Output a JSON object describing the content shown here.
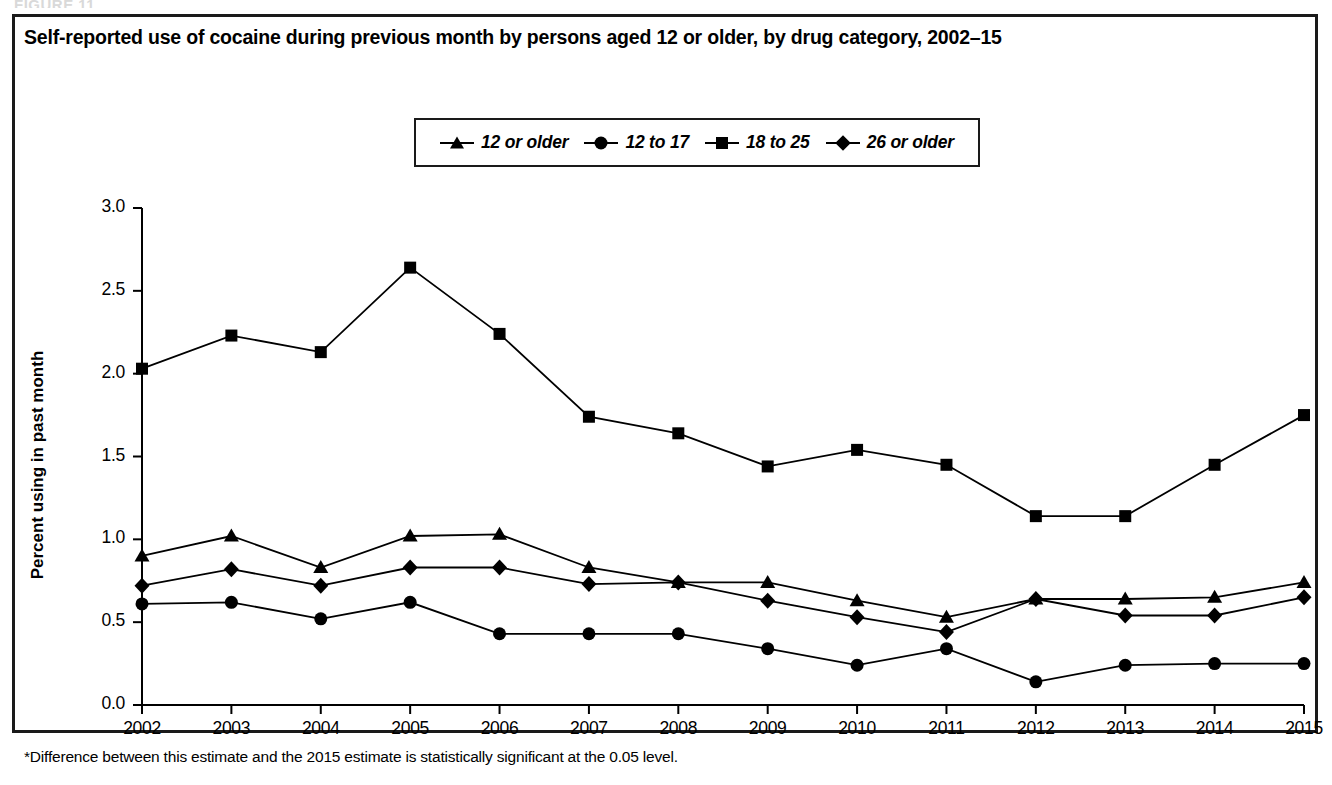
{
  "figure": {
    "number_label": "FIGURE 11",
    "title": "Self-reported use of cocaine during previous month by persons aged 12 or older, by drug category, 2002–15",
    "footnote": "*Difference between this estimate and the 2015 estimate is statistically significant at the 0.05 level."
  },
  "axes": {
    "y_title": "Percent using in past month",
    "y_ticks": [
      "0.0",
      "0.5",
      "1.0",
      "1.5",
      "2.0",
      "2.5",
      "3.0"
    ],
    "x_ticks": [
      "2002",
      "2003",
      "2004",
      "2005",
      "2006",
      "2007",
      "2008",
      "2009",
      "2010",
      "2011",
      "2012",
      "2013",
      "2014",
      "2015"
    ]
  },
  "legend": {
    "items": [
      {
        "label": "12 or older",
        "marker": "triangle-marker-icon"
      },
      {
        "label": "12 to 17",
        "marker": "circle-marker-icon"
      },
      {
        "label": "18 to 25",
        "marker": "square-marker-icon"
      },
      {
        "label": "26 or older",
        "marker": "diamond-marker-icon"
      }
    ]
  },
  "colors": {
    "ink": "#000000",
    "frame": "#1a1a1a",
    "background": "#ffffff"
  },
  "chart_data": {
    "type": "line",
    "title": "Self-reported use of cocaine during previous month by persons aged 12 or older, by drug category, 2002–15",
    "xlabel": "",
    "ylabel": "Percent using in past month",
    "x": [
      2002,
      2003,
      2004,
      2005,
      2006,
      2007,
      2008,
      2009,
      2010,
      2011,
      2012,
      2013,
      2014,
      2015
    ],
    "categories": [
      "2002",
      "2003",
      "2004",
      "2005",
      "2006",
      "2007",
      "2008",
      "2009",
      "2010",
      "2011",
      "2012",
      "2013",
      "2014",
      "2015"
    ],
    "ylim": [
      0.0,
      3.0
    ],
    "ytick_step": 0.5,
    "grid": false,
    "legend_position": "top-center",
    "series": [
      {
        "name": "12 or older",
        "marker": "triangle",
        "values": [
          0.9,
          1.02,
          0.83,
          1.02,
          1.03,
          0.83,
          0.74,
          0.74,
          0.63,
          0.53,
          0.64,
          0.64,
          0.65,
          0.74
        ]
      },
      {
        "name": "12 to 17",
        "marker": "circle",
        "values": [
          0.61,
          0.62,
          0.52,
          0.62,
          0.43,
          0.43,
          0.43,
          0.34,
          0.24,
          0.34,
          0.14,
          0.24,
          0.25,
          0.25
        ]
      },
      {
        "name": "18 to 25",
        "marker": "square",
        "values": [
          2.03,
          2.23,
          2.13,
          2.64,
          2.24,
          1.74,
          1.64,
          1.44,
          1.54,
          1.45,
          1.14,
          1.14,
          1.45,
          1.75
        ]
      },
      {
        "name": "26 or older",
        "marker": "diamond",
        "values": [
          0.72,
          0.82,
          0.72,
          0.83,
          0.83,
          0.73,
          0.74,
          0.63,
          0.53,
          0.44,
          0.64,
          0.54,
          0.54,
          0.65
        ]
      }
    ]
  }
}
